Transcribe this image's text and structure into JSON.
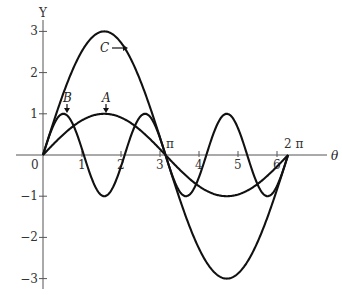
{
  "chart_data": {
    "type": "line",
    "title": "",
    "xlabel": "θ",
    "ylabel": "Y",
    "xlim": [
      0,
      6.2832
    ],
    "ylim": [
      -3,
      3
    ],
    "grid": false,
    "x_ticks": [
      "1",
      "2",
      "3",
      "4",
      "5",
      "6"
    ],
    "x_tick_values": [
      1,
      2,
      3,
      4,
      5,
      6
    ],
    "x_special_labels": [
      {
        "value": 3.1416,
        "label": "π"
      },
      {
        "value": 6.2832,
        "label": "2 π"
      }
    ],
    "y_ticks": [
      "3",
      "2",
      "1",
      "−1",
      "−2",
      "−3"
    ],
    "y_tick_values": [
      3,
      2,
      1,
      -1,
      -2,
      -3
    ],
    "origin_label": "0",
    "series": [
      {
        "name": "A",
        "formula": "sin θ",
        "amplitude": 1,
        "frequency": 1,
        "x": [
          0,
          0.5236,
          1.0472,
          1.5708,
          2.0944,
          2.618,
          3.1416,
          3.6652,
          4.1888,
          4.7124,
          5.236,
          5.7596,
          6.2832
        ],
        "values": [
          0,
          0.5,
          0.866,
          1,
          0.866,
          0.5,
          0,
          -0.5,
          -0.866,
          -1,
          -0.866,
          -0.5,
          0
        ]
      },
      {
        "name": "B",
        "formula": "sin 3θ",
        "amplitude": 1,
        "frequency": 3,
        "x": [
          0,
          0.5236,
          1.0472,
          1.5708,
          2.0944,
          2.618,
          3.1416,
          3.6652,
          4.1888,
          4.7124,
          5.236,
          5.7596,
          6.2832
        ],
        "values": [
          0,
          1,
          0,
          -1,
          0,
          1,
          0,
          -1,
          0,
          1,
          0,
          -1,
          0
        ]
      },
      {
        "name": "C",
        "formula": "3 sin θ",
        "amplitude": 3,
        "frequency": 1,
        "x": [
          0,
          0.5236,
          1.0472,
          1.5708,
          2.0944,
          2.618,
          3.1416,
          3.6652,
          4.1888,
          4.7124,
          5.236,
          5.7596,
          6.2832
        ],
        "values": [
          0,
          1.5,
          2.598,
          3,
          2.598,
          1.5,
          0,
          -1.5,
          -2.598,
          -3,
          -2.598,
          -1.5,
          0
        ]
      }
    ],
    "annotations": [
      {
        "text": "A",
        "points_to": "curve A peak",
        "arrow": "down"
      },
      {
        "text": "B",
        "points_to": "curve B first peak",
        "arrow": "down"
      },
      {
        "text": "C",
        "points_to": "curve C",
        "arrow": "right"
      }
    ]
  },
  "labels": {
    "y_axis": "Y",
    "x_axis": "θ",
    "origin": "0",
    "pi": "π",
    "two_pi": "2 π",
    "curve_a": "A",
    "curve_b": "B",
    "curve_c": "C"
  }
}
